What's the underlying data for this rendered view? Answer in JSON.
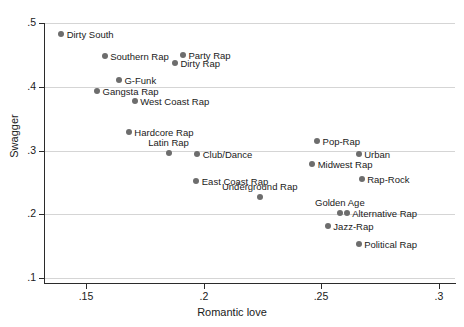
{
  "chart_data": {
    "type": "scatter",
    "title": "",
    "xlabel": "Romantic love",
    "ylabel": "Swagger",
    "xlim": [
      0.132,
      0.3069
    ],
    "ylim": [
      0.1,
      0.5
    ],
    "xticks": [
      0.15,
      0.2,
      0.25,
      0.3
    ],
    "xticklabels": [
      ".15",
      ".2",
      ".25",
      ".3"
    ],
    "yticks": [
      0.1,
      0.2,
      0.3,
      0.4,
      0.5
    ],
    "yticklabels": [
      ".1",
      ".2",
      ".3",
      ".4",
      ".5"
    ],
    "grid": "horizontal",
    "legend": "none",
    "marker_color": "#6d6d6d",
    "points": [
      {
        "label": "Dirty South",
        "x": 0.1393,
        "y": 0.4828,
        "label_pos": "right"
      },
      {
        "label": "Southern Rap",
        "x": 0.1578,
        "y": 0.4484,
        "label_pos": "right"
      },
      {
        "label": "Party Rap",
        "x": 0.1911,
        "y": 0.45,
        "label_pos": "right"
      },
      {
        "label": "Dirty Rap",
        "x": 0.1877,
        "y": 0.4375,
        "label_pos": "right"
      },
      {
        "label": "G-Funk",
        "x": 0.1639,
        "y": 0.4109,
        "label_pos": "right"
      },
      {
        "label": "Gangsta Rap",
        "x": 0.1546,
        "y": 0.3937,
        "label_pos": "right"
      },
      {
        "label": "West Coast Rap",
        "x": 0.1706,
        "y": 0.3781,
        "label_pos": "right"
      },
      {
        "label": "Hardcore Rap",
        "x": 0.1681,
        "y": 0.3296,
        "label_pos": "right"
      },
      {
        "label": "Latin Rap",
        "x": 0.185,
        "y": 0.2966,
        "label_pos": "above"
      },
      {
        "label": "Club/Dance",
        "x": 0.1972,
        "y": 0.295,
        "label_pos": "right"
      },
      {
        "label": "East Coast Rap",
        "x": 0.1968,
        "y": 0.2527,
        "label_pos": "right"
      },
      {
        "label": "Underground Rap",
        "x": 0.2238,
        "y": 0.2276,
        "label_pos": "above"
      },
      {
        "label": "Pop-Rap",
        "x": 0.2482,
        "y": 0.3154,
        "label_pos": "right"
      },
      {
        "label": "Urban",
        "x": 0.2659,
        "y": 0.295,
        "label_pos": "right"
      },
      {
        "label": "Midwest Rap",
        "x": 0.2461,
        "y": 0.2793,
        "label_pos": "right"
      },
      {
        "label": "Rap-Rock",
        "x": 0.2672,
        "y": 0.2558,
        "label_pos": "right"
      },
      {
        "label": "Golden Age",
        "x": 0.2579,
        "y": 0.2024,
        "label_pos": "above"
      },
      {
        "label": "Alternative Rap",
        "x": 0.2608,
        "y": 0.2024,
        "label_pos": "right"
      },
      {
        "label": "Jazz-Rap",
        "x": 0.2528,
        "y": 0.182,
        "label_pos": "right"
      },
      {
        "label": "Political Rap",
        "x": 0.2659,
        "y": 0.1538,
        "label_pos": "right"
      }
    ]
  },
  "axes": {
    "x_title": "Romantic love",
    "y_title": "Swagger"
  }
}
